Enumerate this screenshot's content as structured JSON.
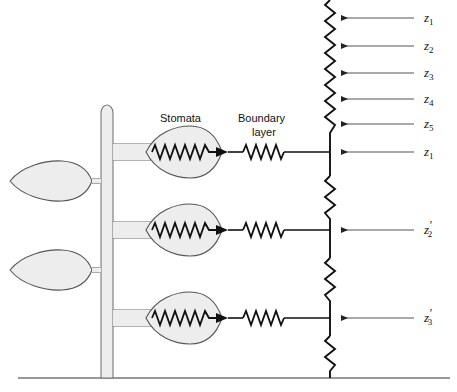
{
  "figure": {
    "background_color": "#ffffff",
    "line_color": "#111111",
    "fill_color": "#eeeeee",
    "width": 457,
    "height": 392
  },
  "labels": {
    "stomata": "Stomata",
    "boundary_layer_line1": "Boundary",
    "boundary_layer_line2": "layer"
  },
  "flux_arrows": [
    {
      "symbol": "z",
      "subscript": "1",
      "prime": "",
      "full": "z1",
      "y": 18
    },
    {
      "symbol": "z",
      "subscript": "2",
      "prime": "",
      "full": "z2",
      "y": 46
    },
    {
      "symbol": "z",
      "subscript": "3",
      "prime": "",
      "full": "z3",
      "y": 73
    },
    {
      "symbol": "z",
      "subscript": "4",
      "prime": "",
      "full": "z4",
      "y": 99
    },
    {
      "symbol": "z",
      "subscript": "5",
      "prime": "",
      "full": "z5",
      "y": 124
    },
    {
      "symbol": "z",
      "subscript": "1",
      "prime": "",
      "full": "z1",
      "y": 152
    },
    {
      "symbol": "z",
      "subscript": "2",
      "prime": "'",
      "full": "z'2",
      "y": 230
    },
    {
      "symbol": "z",
      "subscript": "3",
      "prime": "'",
      "full": "z'3",
      "y": 318
    }
  ],
  "branches": [
    {
      "name": "upper-branch",
      "y": 152,
      "stomata_resistor": true,
      "boundary_resistor": true
    },
    {
      "name": "middle-branch",
      "y": 230,
      "stomata_resistor": true,
      "boundary_resistor": true
    },
    {
      "name": "lower-branch",
      "y": 318,
      "stomata_resistor": true,
      "boundary_resistor": true
    }
  ],
  "leaves": [
    {
      "name": "upper-leaf",
      "cy": 181,
      "petiole_y": 181
    },
    {
      "name": "lower-leaf",
      "cy": 270,
      "petiole_y": 270
    }
  ],
  "geometry": {
    "stem_x": 101,
    "stem_width": 12,
    "stem_top": 105,
    "ground_y": 378,
    "bus_x": 330,
    "label_x": 424,
    "arrow_tail_x": 414,
    "arrow_head_x": 340
  },
  "colors": {
    "ink": "#111111",
    "fill": "#ededed",
    "fill_stroke": "#555555",
    "arrow_line": "#444444"
  }
}
